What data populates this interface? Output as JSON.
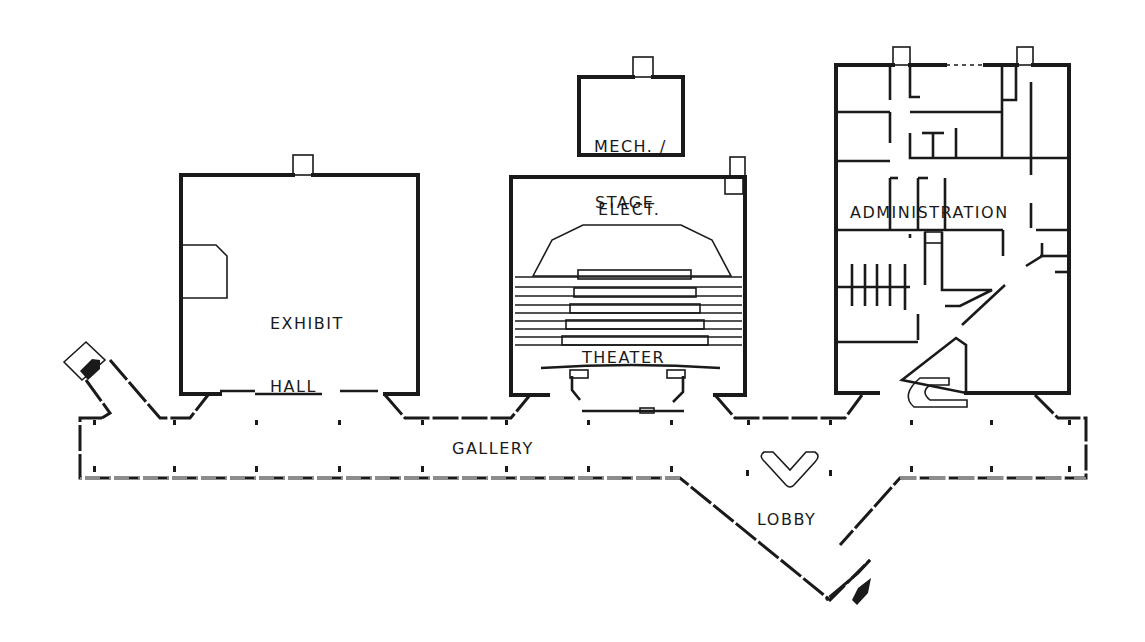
{
  "rooms": {
    "mech_elect": {
      "line1": "MECH. /",
      "line2": "ELECT."
    },
    "stage": {
      "label": "STAGE"
    },
    "theater": {
      "label": "THEATER"
    },
    "exhibit_hall": {
      "line1": "EXHIBIT",
      "line2": "HALL"
    },
    "administration": {
      "label": "ADMINISTRATION"
    },
    "gallery": {
      "label": "GALLERY"
    },
    "lobby": {
      "label": "LOBBY"
    }
  },
  "entrances": [
    {
      "name": "west-entrance",
      "direction": "south-east"
    },
    {
      "name": "main-entrance",
      "direction": "north-west"
    }
  ],
  "colors": {
    "ink": "#1a1a1a",
    "paper": "#ffffff"
  },
  "theater_seating": {
    "rows": 5
  }
}
